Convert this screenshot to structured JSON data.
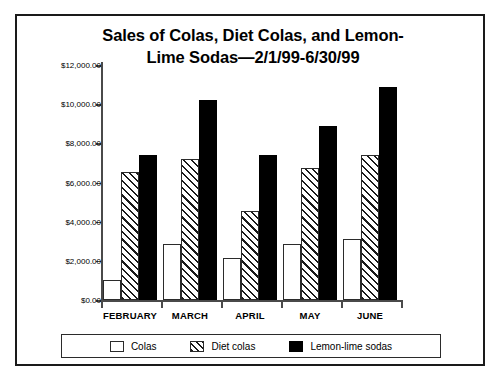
{
  "chart_data": {
    "type": "bar",
    "title_line1": "Sales of Colas, Diet Colas, and Lemon-",
    "title_line2": "Lime Sodas—2/1/99-6/30/99",
    "xlabel": "",
    "ylabel": "",
    "categories": [
      "FEBRUARY",
      "MARCH",
      "APRIL",
      "MAY",
      "JUNE"
    ],
    "series": [
      {
        "name": "Colas",
        "values": [
          1000,
          2850,
          2150,
          2850,
          3100
        ]
      },
      {
        "name": "Diet colas",
        "values": [
          6550,
          7200,
          4550,
          6750,
          7400
        ]
      },
      {
        "name": "Lemon-lime sodas",
        "values": [
          7400,
          10200,
          7400,
          8900,
          10900
        ]
      }
    ],
    "ylim": [
      0,
      12000
    ],
    "ytick_values": [
      0,
      2000,
      4000,
      6000,
      8000,
      10000,
      12000
    ],
    "ytick_labels": [
      "$0.00",
      "$2,000.00",
      "$4,000.00",
      "$6,000.00",
      "$8,000.00",
      "$10,000.00",
      "$12,000.00"
    ],
    "grid": false,
    "legend_position": "bottom",
    "colors": {
      "colas": "#ffffff",
      "diet_colas": "#ffffff",
      "lemon_lime_sodas": "#000000",
      "outline": "#2b2b2b",
      "axis": "#4a4a4a",
      "text": "#000000",
      "frame": "#1a1a1a",
      "background": "#ffffff"
    }
  },
  "legend": {
    "items": [
      {
        "label": "Colas",
        "pattern": "outline"
      },
      {
        "label": "Diet colas",
        "pattern": "diagonal-hatch"
      },
      {
        "label": "Lemon-lime sodas",
        "pattern": "solid-black"
      }
    ]
  }
}
